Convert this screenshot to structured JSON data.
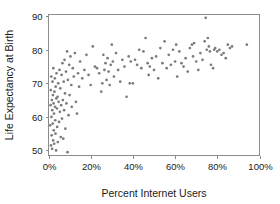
{
  "chart_data": {
    "type": "scatter",
    "title": "",
    "xlabel": "Percent Internet Users",
    "ylabel": "Life Expectancy at Birth",
    "xlim": [
      0,
      100
    ],
    "ylim": [
      48.5,
      90.5
    ],
    "grid": false,
    "legend": null,
    "point_color": "#7b7b7b",
    "frame_color": "#8c8c8c",
    "xticks": [
      0,
      20,
      40,
      60,
      80,
      100
    ],
    "xticklabels": [
      "0%",
      "20%",
      "40%",
      "60%",
      "80%",
      "100%"
    ],
    "yticks": [
      50,
      60,
      70,
      80,
      90
    ],
    "yticklabels": [
      "50",
      "60",
      "70",
      "80",
      "90"
    ],
    "points": [
      [
        0.8,
        57.5
      ],
      [
        1.0,
        63.5
      ],
      [
        1.1,
        68.0
      ],
      [
        1.2,
        51.5
      ],
      [
        1.3,
        72.0
      ],
      [
        1.4,
        60.0
      ],
      [
        1.5,
        54.5
      ],
      [
        1.6,
        65.0
      ],
      [
        1.7,
        50.5
      ],
      [
        1.8,
        62.0
      ],
      [
        1.9,
        70.5
      ],
      [
        2.0,
        58.0
      ],
      [
        2.1,
        66.5
      ],
      [
        2.2,
        53.0
      ],
      [
        2.3,
        74.5
      ],
      [
        2.4,
        64.0
      ],
      [
        2.5,
        56.0
      ],
      [
        2.6,
        61.0
      ],
      [
        2.7,
        52.0
      ],
      [
        2.8,
        67.5
      ],
      [
        3.0,
        71.5
      ],
      [
        3.1,
        63.0
      ],
      [
        3.2,
        59.0
      ],
      [
        3.3,
        55.0
      ],
      [
        3.4,
        69.0
      ],
      [
        3.6,
        50.0
      ],
      [
        3.7,
        65.5
      ],
      [
        3.8,
        73.0
      ],
      [
        4.0,
        62.5
      ],
      [
        4.1,
        57.0
      ],
      [
        4.3,
        66.0
      ],
      [
        4.4,
        52.5
      ],
      [
        4.6,
        70.0
      ],
      [
        4.8,
        64.5
      ],
      [
        5.0,
        58.5
      ],
      [
        5.2,
        74.0
      ],
      [
        5.4,
        61.5
      ],
      [
        5.6,
        68.5
      ],
      [
        5.8,
        54.0
      ],
      [
        6.0,
        63.5
      ],
      [
        6.2,
        72.5
      ],
      [
        6.4,
        59.5
      ],
      [
        6.6,
        76.0
      ],
      [
        6.8,
        65.0
      ],
      [
        7.0,
        53.5
      ],
      [
        7.2,
        70.5
      ],
      [
        7.4,
        62.0
      ],
      [
        7.6,
        77.0
      ],
      [
        7.8,
        67.0
      ],
      [
        8.0,
        56.5
      ],
      [
        8.3,
        73.5
      ],
      [
        8.5,
        64.0
      ],
      [
        8.8,
        79.5
      ],
      [
        9.0,
        49.5
      ],
      [
        9.2,
        71.0
      ],
      [
        9.5,
        60.5
      ],
      [
        9.8,
        75.5
      ],
      [
        10.0,
        66.5
      ],
      [
        10.4,
        78.0
      ],
      [
        10.8,
        69.5
      ],
      [
        11.0,
        63.0
      ],
      [
        11.5,
        74.5
      ],
      [
        12.0,
        72.0
      ],
      [
        12.5,
        79.0
      ],
      [
        13.0,
        64.5
      ],
      [
        13.5,
        61.0
      ],
      [
        14.0,
        73.0
      ],
      [
        14.5,
        69.0
      ],
      [
        15.0,
        76.5
      ],
      [
        16.0,
        71.5
      ],
      [
        17.0,
        74.0
      ],
      [
        18.0,
        78.5
      ],
      [
        19.0,
        72.5
      ],
      [
        20.0,
        69.5
      ],
      [
        21.0,
        81.0
      ],
      [
        22.0,
        75.0
      ],
      [
        23.0,
        74.5
      ],
      [
        24.0,
        73.0
      ],
      [
        25.0,
        67.5
      ],
      [
        25.5,
        70.0
      ],
      [
        26.0,
        78.5
      ],
      [
        26.5,
        74.0
      ],
      [
        27.0,
        76.0
      ],
      [
        27.5,
        71.0
      ],
      [
        28.0,
        77.5
      ],
      [
        28.5,
        73.5
      ],
      [
        29.0,
        69.5
      ],
      [
        29.5,
        75.5
      ],
      [
        30.0,
        81.5
      ],
      [
        30.5,
        76.5
      ],
      [
        31.0,
        72.0
      ],
      [
        32.0,
        79.0
      ],
      [
        33.0,
        74.0
      ],
      [
        34.0,
        70.5
      ],
      [
        35.0,
        77.0
      ],
      [
        36.0,
        75.0
      ],
      [
        37.0,
        66.0
      ],
      [
        38.0,
        78.0
      ],
      [
        38.5,
        70.0
      ],
      [
        39.0,
        76.5
      ],
      [
        40.0,
        70.0
      ],
      [
        41.0,
        77.0
      ],
      [
        42.0,
        75.5
      ],
      [
        43.0,
        80.0
      ],
      [
        44.0,
        74.5
      ],
      [
        45.0,
        79.5
      ],
      [
        46.0,
        83.5
      ],
      [
        47.0,
        76.0
      ],
      [
        47.5,
        72.5
      ],
      [
        48.0,
        75.0
      ],
      [
        49.0,
        77.5
      ],
      [
        50.0,
        74.0
      ],
      [
        51.0,
        78.0
      ],
      [
        52.0,
        71.5
      ],
      [
        53.0,
        80.5
      ],
      [
        54.0,
        76.0
      ],
      [
        55.0,
        82.5
      ],
      [
        56.0,
        74.5
      ],
      [
        57.0,
        78.5
      ],
      [
        58.0,
        75.5
      ],
      [
        59.0,
        80.0
      ],
      [
        60.0,
        76.5
      ],
      [
        60.5,
        81.5
      ],
      [
        61.0,
        72.0
      ],
      [
        62.0,
        79.5
      ],
      [
        63.0,
        76.0
      ],
      [
        64.0,
        75.0
      ],
      [
        65.0,
        77.5
      ],
      [
        66.0,
        73.5
      ],
      [
        67.0,
        80.5
      ],
      [
        68.0,
        81.5
      ],
      [
        68.5,
        78.0
      ],
      [
        69.0,
        82.0
      ],
      [
        70.0,
        76.5
      ],
      [
        71.0,
        74.0
      ],
      [
        72.0,
        79.0
      ],
      [
        73.0,
        77.0
      ],
      [
        74.0,
        82.5
      ],
      [
        74.5,
        89.5
      ],
      [
        75.0,
        80.0
      ],
      [
        75.5,
        83.5
      ],
      [
        76.0,
        81.0
      ],
      [
        76.5,
        79.5
      ],
      [
        77.0,
        75.5
      ],
      [
        78.0,
        74.5
      ],
      [
        78.5,
        80.0
      ],
      [
        79.0,
        80.5
      ],
      [
        80.0,
        79.5
      ],
      [
        81.0,
        80.0
      ],
      [
        82.0,
        78.5
      ],
      [
        83.0,
        79.0
      ],
      [
        84.0,
        77.5
      ],
      [
        85.0,
        81.5
      ],
      [
        86.0,
        80.5
      ],
      [
        87.0,
        81.0
      ],
      [
        94.0,
        81.5
      ]
    ]
  }
}
